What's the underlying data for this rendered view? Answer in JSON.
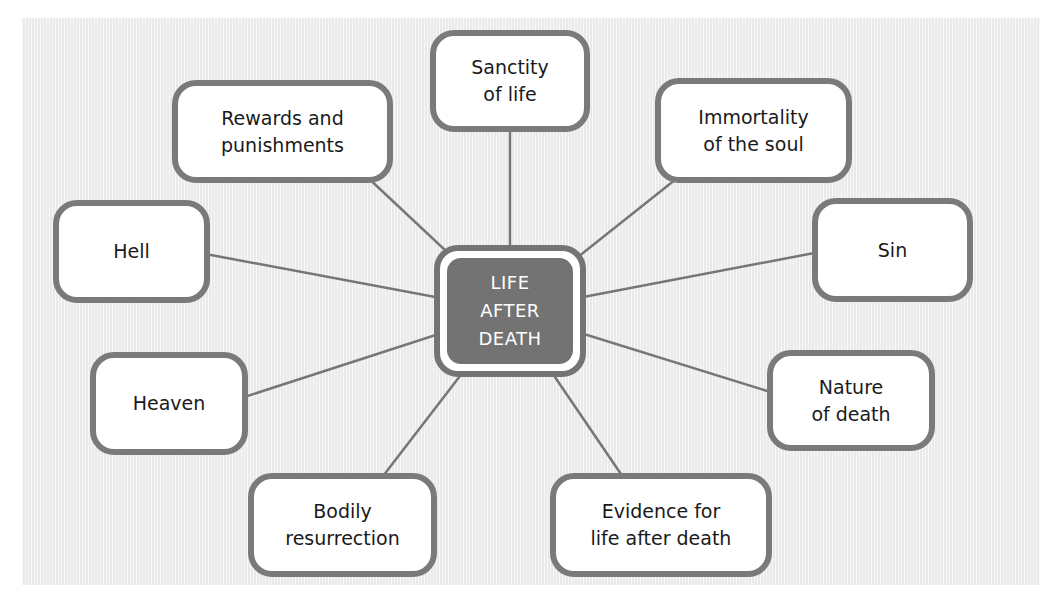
{
  "diagram": {
    "type": "spider-diagram",
    "center": {
      "label": "LIFE\nAFTER\nDEATH",
      "fill": "#737373",
      "text_color": "#ffffff"
    },
    "colors": {
      "background": "#efefef",
      "border": "#7a7a7a",
      "line": "#767676",
      "node_fill": "#ffffff"
    },
    "nodes": [
      {
        "id": "sanctity",
        "label": "Sanctity\nof life"
      },
      {
        "id": "immortality",
        "label": "Immortality\nof the soul"
      },
      {
        "id": "sin",
        "label": "Sin"
      },
      {
        "id": "nature",
        "label": "Nature\nof death"
      },
      {
        "id": "evidence",
        "label": "Evidence for\nlife after death"
      },
      {
        "id": "bodily",
        "label": "Bodily\nresurrection"
      },
      {
        "id": "heaven",
        "label": "Heaven"
      },
      {
        "id": "hell",
        "label": "Hell"
      },
      {
        "id": "rewards",
        "label": "Rewards and\npunishments"
      }
    ]
  }
}
